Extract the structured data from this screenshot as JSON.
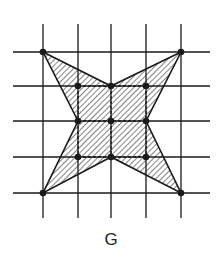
{
  "figure": {
    "label": "G",
    "grid": {
      "x_lines": [
        43,
        78,
        111,
        146,
        181
      ],
      "y_lines": [
        52,
        86,
        121,
        157,
        193
      ],
      "x_extent": [
        13,
        210
      ],
      "y_extent": [
        24,
        218
      ],
      "color": "#1a1a1a"
    },
    "star_polygon": [
      [
        43,
        52
      ],
      [
        111,
        86
      ],
      [
        181,
        52
      ],
      [
        146,
        121
      ],
      [
        181,
        193
      ],
      [
        111,
        157
      ],
      [
        43,
        193
      ],
      [
        78,
        121
      ]
    ],
    "points": [
      [
        43,
        52
      ],
      [
        181,
        52
      ],
      [
        43,
        193
      ],
      [
        181,
        193
      ],
      [
        78,
        86
      ],
      [
        111,
        86
      ],
      [
        146,
        86
      ],
      [
        78,
        121
      ],
      [
        111,
        121
      ],
      [
        146,
        121
      ],
      [
        78,
        157
      ],
      [
        111,
        157
      ],
      [
        146,
        157
      ]
    ],
    "fill_pattern": "diagonal-hatch",
    "colors": {
      "line": "#1a1a1a",
      "background": "#ffffff"
    }
  }
}
